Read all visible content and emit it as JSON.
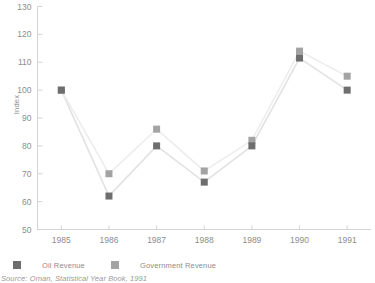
{
  "chart_data": {
    "type": "line",
    "title": "",
    "subtitle": "",
    "xlabel": "",
    "ylabel": "Index",
    "categories": [
      "1985",
      "1986",
      "1987",
      "1988",
      "1989",
      "1990",
      "1991"
    ],
    "series": [
      {
        "name": "Oil Revenue",
        "color": "#6e6e6e",
        "values": [
          100,
          62,
          80,
          67,
          80,
          111.5,
          100
        ]
      },
      {
        "name": "Government Revenue",
        "color": "#a3a3a3",
        "values": [
          100,
          70,
          86,
          71,
          82,
          114,
          105
        ]
      }
    ],
    "ylim": [
      50,
      130
    ],
    "yticks": [
      50,
      60,
      70,
      80,
      90,
      100,
      110,
      120,
      130
    ],
    "ytick_labels": [
      "50",
      "60",
      "70",
      "80",
      "90",
      "100",
      "110",
      "120",
      "130"
    ],
    "grid": false,
    "legend_position": "bottom-left",
    "marker": "square",
    "source_note": "Source: Oman, Statistical Year Book, 1991"
  },
  "legend": {
    "oil_label": "Oil Revenue",
    "gov_label": "Government Revenue"
  },
  "axes": {
    "y_title": "Index"
  },
  "colors": {
    "oil": "#6e6e6e",
    "gov": "#a3a3a3",
    "axis": "#d4d4d4",
    "text": "#8d8d8d",
    "line_oil": "#e2e2e2",
    "line_gov": "#ededed"
  }
}
